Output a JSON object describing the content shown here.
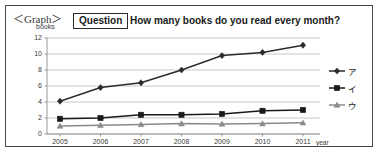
{
  "figure": {
    "graph_label": "＜Graph＞",
    "question_tag": "Question",
    "question_text": "How many books do you read every month?"
  },
  "chart_data": {
    "type": "line",
    "title": "How many books do you read every month?",
    "xlabel": "year",
    "ylabel": "books",
    "categories": [
      "2005",
      "2006",
      "2007",
      "2008",
      "2009",
      "2010",
      "2011"
    ],
    "ylim": [
      0,
      12
    ],
    "yticks": [
      0,
      2,
      4,
      6,
      8,
      10,
      12
    ],
    "grid": "horizontal",
    "legend_position": "right",
    "series": [
      {
        "name": "ア",
        "marker": "diamond",
        "color": "#2b2b2b",
        "values": [
          4.1,
          5.8,
          6.4,
          8.0,
          9.8,
          10.2,
          11.1
        ]
      },
      {
        "name": "イ",
        "marker": "square",
        "color": "#1a1a1a",
        "values": [
          1.9,
          2.0,
          2.4,
          2.4,
          2.5,
          2.9,
          3.0
        ]
      },
      {
        "name": "ウ",
        "marker": "triangle",
        "color": "#8a8a8a",
        "values": [
          1.0,
          1.1,
          1.2,
          1.3,
          1.25,
          1.3,
          1.4
        ]
      }
    ]
  }
}
